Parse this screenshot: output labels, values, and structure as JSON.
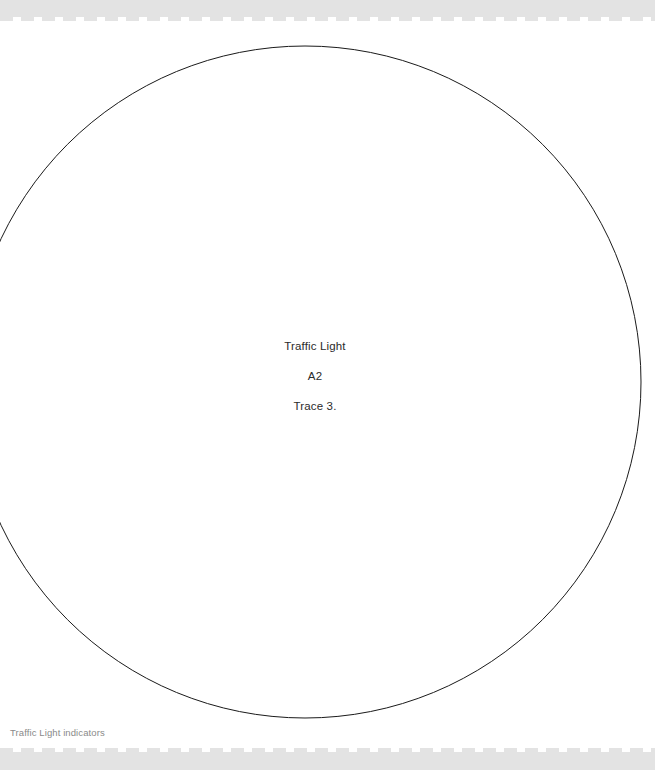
{
  "page": {
    "width": 655,
    "height": 770,
    "background_color": "#ffffff"
  },
  "decorations": {
    "band_color": "#e3e3e3",
    "top_band_name": "perforated-edge-top",
    "bottom_band_name": "perforated-edge-bottom"
  },
  "figure": {
    "shape": "circle",
    "stroke_color": "#1a1a1a",
    "stroke_width": 1,
    "fill": "none",
    "center_x": 305,
    "center_y": 382,
    "radius": 336,
    "clipped_edge": "left"
  },
  "center_label": {
    "line1": "Traffic Light",
    "line2": "A2",
    "line3": "Trace 3.",
    "color": "#2b2b2b"
  },
  "caption": {
    "text": "Traffic Light indicators",
    "color": "#8a8a8a"
  }
}
